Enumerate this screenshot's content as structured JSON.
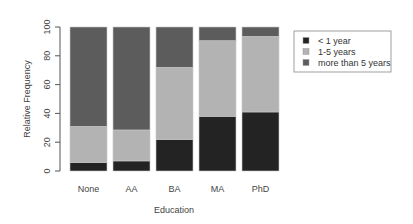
{
  "chart_data": {
    "type": "bar",
    "stacked": true,
    "title": "",
    "xlabel": "Education",
    "ylabel": "Relative Frequency",
    "ylim": [
      0,
      100
    ],
    "yticks": [
      0,
      20,
      40,
      60,
      80,
      100
    ],
    "categories": [
      "None",
      "AA",
      "BA",
      "MA",
      "PhD"
    ],
    "series": [
      {
        "name": "< 1 year",
        "color": "#232323",
        "values": [
          6,
          7,
          22,
          38,
          41
        ]
      },
      {
        "name": "1-5 years",
        "color": "#b3b3b3",
        "values": [
          25,
          21.5,
          50,
          52.5,
          52.5
        ]
      },
      {
        "name": "more than 5 years",
        "color": "#5c5c5c",
        "values": [
          69,
          71.5,
          28,
          9.5,
          6.5
        ]
      }
    ],
    "legend_position": "right",
    "grid": false
  }
}
